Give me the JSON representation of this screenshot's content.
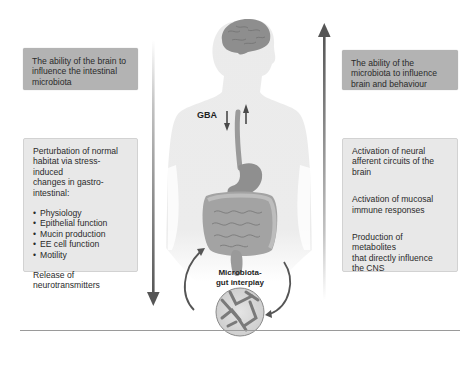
{
  "diagram": {
    "center_labels": {
      "gba": "GBA",
      "interplay_line1": "Microbiota-",
      "interplay_line2": "gut interplay"
    },
    "left": {
      "direction": "down",
      "header": "The ability of the brain to influence the intestinal microbiota",
      "header_lines": [
        "The ability of the brain to",
        "influence the intestinal",
        "microbiota"
      ],
      "detail": {
        "intro_lines": [
          "Perturbation of normal",
          "habitat via stress-induced",
          "changes in gastro-",
          "intestinal:"
        ],
        "bullets": [
          "Physiology",
          "Epithelial function",
          "Mucin production",
          "EE cell function",
          "Motility"
        ],
        "outro_lines": [
          "Release of",
          "neurotransmitters"
        ]
      }
    },
    "right": {
      "direction": "up",
      "header": "The ability of the microbiota to influence brain and behaviour",
      "header_lines": [
        "The ability of the",
        "microbiota to influence",
        "brain and behaviour"
      ],
      "detail": {
        "items": [
          {
            "lines": [
              "Activation of neural",
              "afferent circuits of the",
              "brain"
            ]
          },
          {
            "lines": [
              "Activation of mucosal",
              "immune responses"
            ]
          },
          {
            "lines": [
              "Production of metabolites",
              "that directly influence",
              "the CNS"
            ]
          }
        ]
      }
    },
    "colors": {
      "header_box": "#b3b3b3",
      "detail_box": "#e8e8e8",
      "arrow": "#555555",
      "silhouette": "#ececec",
      "organ": "#9a9a9a"
    }
  }
}
